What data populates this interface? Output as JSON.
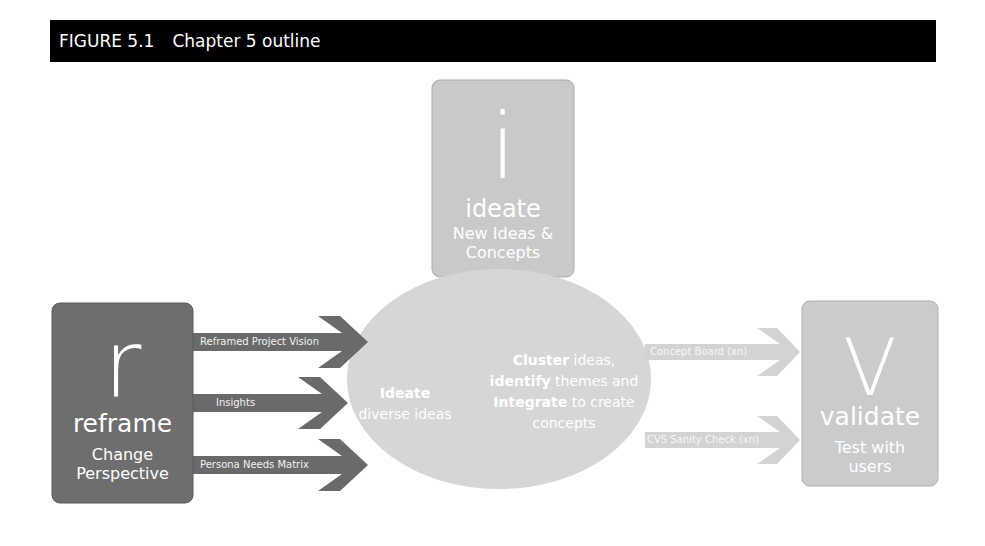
{
  "figure": {
    "number": "FIGURE 5.1",
    "caption": "Chapter 5 outline"
  },
  "colors": {
    "header_bg": "#000000",
    "reframe_box": "#6e6e6e",
    "reframe_arrows": "#6a6a6a",
    "ideate_box": "#c9c9c9",
    "ellipse": "#d6d6d6",
    "validate_box": "#cbcbcb",
    "validate_arrows": "#d3d3d3",
    "text": "#ffffff"
  },
  "stages": {
    "reframe": {
      "letter": "r",
      "name": "reframe",
      "subtitle_line1": "Change",
      "subtitle_line2": "Perspective"
    },
    "ideate": {
      "letter": "i",
      "name": "ideate",
      "subtitle_line1": "New Ideas &",
      "subtitle_line2": "Concepts"
    },
    "validate": {
      "letter": "V",
      "name": "validate",
      "subtitle_line1": "Test with",
      "subtitle_line2": "users"
    }
  },
  "inputs": [
    {
      "label": "Reframed Project Vision"
    },
    {
      "label": "Insights"
    },
    {
      "label": "Persona Needs Matrix"
    }
  ],
  "outputs": [
    {
      "label": "Concept Board (xn)"
    },
    {
      "label": "CVS Sanity Check (xn)"
    }
  ],
  "center": {
    "left_bold": "Ideate",
    "left_rest": "diverse ideas",
    "right_line1_bold": "Cluster",
    "right_line1_rest": " ideas,",
    "right_line2_bold": "identify",
    "right_line2_rest": " themes and",
    "right_line3_bold": "Integrate",
    "right_line3_rest": " to create",
    "right_line4": "concepts"
  }
}
